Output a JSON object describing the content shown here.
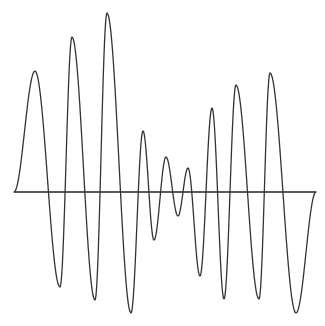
{
  "chart_data": {
    "type": "line",
    "title": "",
    "xlabel": "",
    "ylabel": "",
    "grid": false,
    "legend": null,
    "baseline": {
      "x_start": 14,
      "x_end": 316,
      "y": 192
    },
    "line_color": "#333333",
    "baseline_color": "#222222",
    "points": [
      {
        "x": 14,
        "y": 192
      },
      {
        "x": 35,
        "y": 71
      },
      {
        "x": 60,
        "y": 287
      },
      {
        "x": 72,
        "y": 37
      },
      {
        "x": 95,
        "y": 300
      },
      {
        "x": 107,
        "y": 13
      },
      {
        "x": 131,
        "y": 313
      },
      {
        "x": 143,
        "y": 131
      },
      {
        "x": 154,
        "y": 240
      },
      {
        "x": 166,
        "y": 157
      },
      {
        "x": 178,
        "y": 216
      },
      {
        "x": 188,
        "y": 168
      },
      {
        "x": 200,
        "y": 276
      },
      {
        "x": 212,
        "y": 108
      },
      {
        "x": 224,
        "y": 299
      },
      {
        "x": 236,
        "y": 85
      },
      {
        "x": 259,
        "y": 299
      },
      {
        "x": 270,
        "y": 73
      },
      {
        "x": 296,
        "y": 313
      },
      {
        "x": 316,
        "y": 192
      }
    ]
  }
}
